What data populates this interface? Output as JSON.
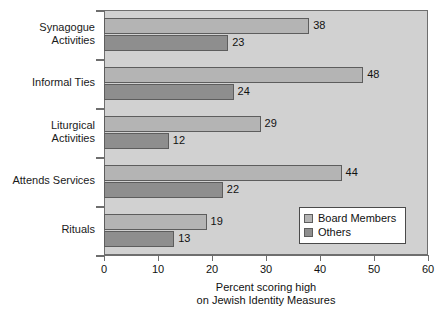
{
  "chart_data": {
    "type": "bar",
    "orientation": "horizontal",
    "title": "",
    "xlabel": "Percent scoring high\non Jewish Identity Measures",
    "xlabel_line1": "Percent scoring high",
    "xlabel_line2": "on Jewish Identity Measures",
    "ylabel": "",
    "xlim": [
      0,
      60
    ],
    "xticks": [
      0,
      10,
      20,
      30,
      40,
      50,
      60
    ],
    "xtick_labels": [
      "0",
      "10",
      "20",
      "30",
      "40",
      "50",
      "60"
    ],
    "grid": false,
    "legend_position": "lower right inside plot",
    "categories": [
      "Synagogue\nActivities",
      "Informal Ties",
      "Liturgical\nActivities",
      "Attends Services",
      "Rituals"
    ],
    "series": [
      {
        "name": "Board Members",
        "color": "#b4b4b4",
        "values": [
          38,
          48,
          29,
          44,
          19
        ]
      },
      {
        "name": "Others",
        "color": "#8e8e8e",
        "values": [
          23,
          24,
          12,
          22,
          13
        ]
      }
    ],
    "data_labels": [
      [
        "38",
        "48",
        "29",
        "44",
        "19"
      ],
      [
        "23",
        "24",
        "12",
        "22",
        "13"
      ]
    ],
    "plot_background": "#d1d1d1",
    "axis_color": "#6e6e6e"
  }
}
